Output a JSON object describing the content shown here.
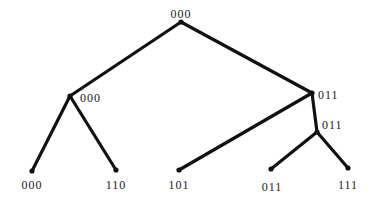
{
  "diagram": {
    "type": "binary-tree",
    "nodes": [
      {
        "id": "root",
        "label": "000",
        "x": 181,
        "y": 22,
        "label_x": 181,
        "label_y": 18,
        "label_anchor": "middle"
      },
      {
        "id": "left",
        "label": "000",
        "x": 70,
        "y": 96,
        "label_x": 80,
        "label_y": 102,
        "label_anchor": "start"
      },
      {
        "id": "right",
        "label": "011",
        "x": 312,
        "y": 93,
        "label_x": 318,
        "label_y": 99,
        "label_anchor": "start"
      },
      {
        "id": "right-right",
        "label": "011",
        "x": 317,
        "y": 132,
        "label_x": 322,
        "label_y": 129,
        "label_anchor": "start"
      },
      {
        "id": "leaf-000",
        "label": "000",
        "x": 32,
        "y": 171,
        "label_x": 32,
        "label_y": 189,
        "label_anchor": "middle"
      },
      {
        "id": "leaf-110",
        "label": "110",
        "x": 116,
        "y": 170,
        "label_x": 116,
        "label_y": 189,
        "label_anchor": "middle"
      },
      {
        "id": "leaf-101",
        "label": "101",
        "x": 179,
        "y": 170,
        "label_x": 179,
        "label_y": 189,
        "label_anchor": "middle"
      },
      {
        "id": "leaf-011",
        "label": "011",
        "x": 271,
        "y": 169,
        "label_x": 272,
        "label_y": 191,
        "label_anchor": "middle"
      },
      {
        "id": "leaf-111",
        "label": "111",
        "x": 348,
        "y": 168,
        "label_x": 348,
        "label_y": 189,
        "label_anchor": "middle"
      }
    ],
    "edges": [
      {
        "from": "root",
        "to": "left"
      },
      {
        "from": "root",
        "to": "right"
      },
      {
        "from": "left",
        "to": "leaf-000"
      },
      {
        "from": "left",
        "to": "leaf-110"
      },
      {
        "from": "right",
        "to": "leaf-101"
      },
      {
        "from": "right",
        "to": "right-right"
      },
      {
        "from": "right-right",
        "to": "leaf-011"
      },
      {
        "from": "right-right",
        "to": "leaf-111"
      }
    ],
    "colors": {
      "line": "#111111",
      "text": "#1a1a1a",
      "background": "#ffffff"
    }
  }
}
